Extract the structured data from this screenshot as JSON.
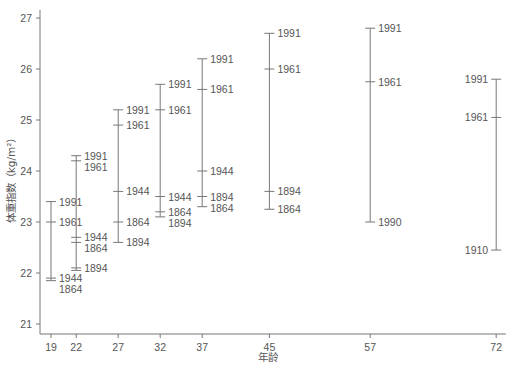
{
  "chart_data": {
    "type": "range-with-markers",
    "title": "",
    "xlabel": "年龄",
    "ylabel": "体重指数（kg/m²）",
    "ylim": [
      21,
      27
    ],
    "yticks": [
      21,
      22,
      23,
      24,
      25,
      26,
      27
    ],
    "xticks": [
      19,
      22,
      27,
      32,
      37,
      45,
      57,
      72
    ],
    "grid": false,
    "groups": [
      {
        "age": 19,
        "points": [
          {
            "label": "1991",
            "value": 23.4
          },
          {
            "label": "1961",
            "value": 23.0
          },
          {
            "label": "1944",
            "value": 21.9
          },
          {
            "label": "1864",
            "value": 21.85
          }
        ]
      },
      {
        "age": 22,
        "points": [
          {
            "label": "1991",
            "value": 24.3
          },
          {
            "label": "1961",
            "value": 24.2
          },
          {
            "label": "1944",
            "value": 22.7
          },
          {
            "label": "1864",
            "value": 22.6
          },
          {
            "label": "1894",
            "value": 22.1
          },
          {
            "label": "1894b",
            "value": 22.05
          }
        ]
      },
      {
        "age": 27,
        "points": [
          {
            "label": "1991",
            "value": 25.2
          },
          {
            "label": "1961",
            "value": 24.9
          },
          {
            "label": "1944",
            "value": 23.6
          },
          {
            "label": "1864",
            "value": 23.0
          },
          {
            "label": "1894",
            "value": 22.6
          }
        ]
      },
      {
        "age": 32,
        "points": [
          {
            "label": "1991",
            "value": 25.7
          },
          {
            "label": "1961",
            "value": 25.2
          },
          {
            "label": "1944",
            "value": 23.5
          },
          {
            "label": "1864",
            "value": 23.2
          },
          {
            "label": "1894",
            "value": 23.1
          }
        ]
      },
      {
        "age": 37,
        "points": [
          {
            "label": "1991",
            "value": 26.2
          },
          {
            "label": "1961",
            "value": 25.6
          },
          {
            "label": "1944",
            "value": 24.0
          },
          {
            "label": "1894",
            "value": 23.5
          },
          {
            "label": "1864",
            "value": 23.3
          }
        ]
      },
      {
        "age": 45,
        "points": [
          {
            "label": "1991",
            "value": 26.7
          },
          {
            "label": "1961",
            "value": 26.0
          },
          {
            "label": "1894",
            "value": 23.6
          },
          {
            "label": "1864",
            "value": 23.25
          }
        ]
      },
      {
        "age": 57,
        "points": [
          {
            "label": "1991",
            "value": 26.8
          },
          {
            "label": "1961",
            "value": 25.75
          },
          {
            "label": "1990",
            "value": 23.0
          }
        ]
      },
      {
        "age": 72,
        "points": [
          {
            "label": "1991",
            "value": 25.8
          },
          {
            "label": "1961",
            "value": 25.05
          },
          {
            "label": "1910",
            "value": 22.45
          }
        ]
      }
    ]
  }
}
